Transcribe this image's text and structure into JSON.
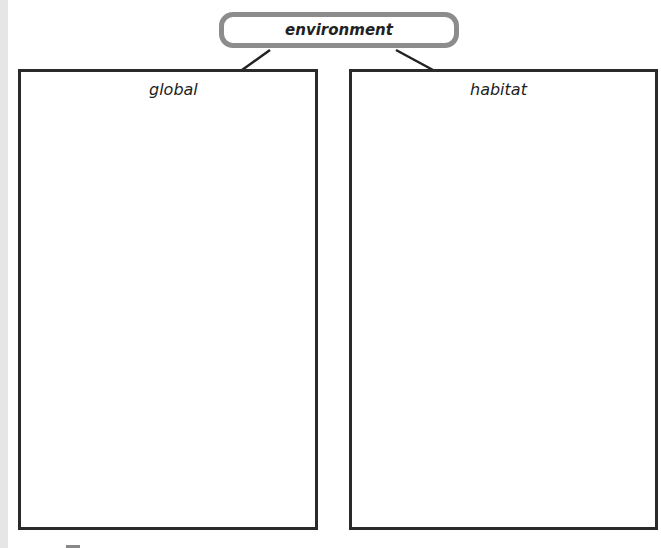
{
  "diagram": {
    "root": {
      "label": "environment"
    },
    "children": [
      {
        "label": "global"
      },
      {
        "label": "habitat"
      }
    ]
  }
}
